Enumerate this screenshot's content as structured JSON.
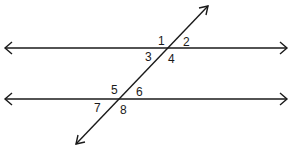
{
  "diagram": {
    "type": "parallel-lines-cut-by-transversal",
    "stroke_color": "#1a1a1a",
    "background": "#ffffff",
    "lines": {
      "top_parallel": {
        "x1": 5,
        "y1": 48,
        "x2": 287,
        "y2": 48,
        "arrows": "both"
      },
      "bottom_parallel": {
        "x1": 5,
        "y1": 99,
        "x2": 287,
        "y2": 99,
        "arrows": "both"
      },
      "transversal": {
        "x1": 76,
        "y1": 144,
        "x2": 208,
        "y2": 6,
        "arrows": "both"
      }
    },
    "angle_labels": [
      {
        "text": "1",
        "x": 158,
        "y": 45
      },
      {
        "text": "2",
        "x": 183,
        "y": 46
      },
      {
        "text": "3",
        "x": 145,
        "y": 61
      },
      {
        "text": "4",
        "x": 168,
        "y": 63
      },
      {
        "text": "5",
        "x": 111,
        "y": 94
      },
      {
        "text": "6",
        "x": 136,
        "y": 96
      },
      {
        "text": "7",
        "x": 94,
        "y": 112
      },
      {
        "text": "8",
        "x": 120,
        "y": 114
      }
    ]
  }
}
